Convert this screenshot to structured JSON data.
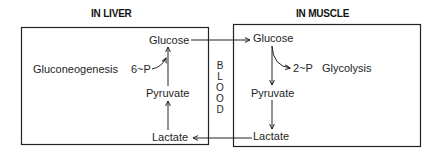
{
  "diagram": {
    "type": "cori-cycle",
    "liver": {
      "title": "IN LIVER",
      "nodes": {
        "glucose": "Glucose",
        "phosphate": "6~P",
        "process": "Gluconeogenesis",
        "pyruvate": "Pyruvate",
        "lactate": "Lactate"
      }
    },
    "blood": {
      "label": "BLOOD",
      "letters": [
        "B",
        "L",
        "O",
        "O",
        "D"
      ]
    },
    "muscle": {
      "title": "IN MUSCLE",
      "nodes": {
        "glucose": "Glucose",
        "phosphate": "2~P",
        "process": "Glycolysis",
        "pyruvate": "Pyruvate",
        "lactate": "Lactate"
      }
    },
    "edges": [
      {
        "from": "liver.lactate",
        "to": "liver.pyruvate"
      },
      {
        "from": "liver.pyruvate",
        "to": "liver.glucose"
      },
      {
        "from": "liver.phosphate",
        "to": "liver.glucose"
      },
      {
        "from": "liver.glucose",
        "to": "muscle.glucose"
      },
      {
        "from": "muscle.glucose",
        "to": "muscle.phosphate"
      },
      {
        "from": "muscle.glucose",
        "to": "muscle.pyruvate"
      },
      {
        "from": "muscle.pyruvate",
        "to": "muscle.lactate"
      },
      {
        "from": "muscle.lactate",
        "to": "liver.lactate"
      }
    ],
    "colors": {
      "line": "#222222",
      "text": "#1e1e1e",
      "background": "#ffffff"
    }
  }
}
